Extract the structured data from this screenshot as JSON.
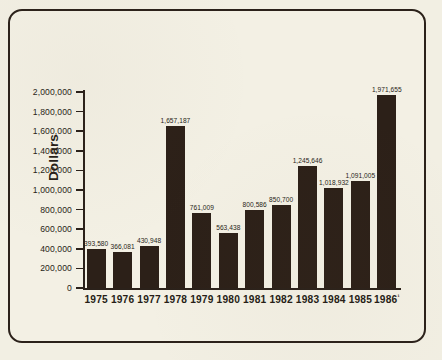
{
  "figure": {
    "background_color": "#f3f0e4",
    "ink_color": "#2b211a",
    "bar_color": "#2c2018"
  },
  "chart_data": {
    "type": "bar",
    "title": "",
    "xlabel": "",
    "ylabel": "Dollars",
    "ylim": [
      0,
      2000000
    ],
    "grid": false,
    "legend": null,
    "categories": [
      "1975",
      "1976",
      "1977",
      "1978",
      "1979",
      "1980",
      "1981",
      "1982",
      "1983",
      "1984",
      "1985",
      "1986"
    ],
    "category_labels": [
      "1975",
      "1976",
      "1977",
      "1978",
      "1979",
      "1980",
      "1981",
      "1982",
      "1983",
      "1984",
      "1985",
      "1986¹"
    ],
    "values": [
      393580,
      366081,
      430948,
      1657187,
      761009,
      563438,
      800586,
      850700,
      1245646,
      1018932,
      1091005,
      1971655
    ],
    "value_labels": [
      "393,580",
      "366,081",
      "430,948",
      "1,657,187",
      "761,009",
      "563,438",
      "800,586",
      "850,700",
      "1,245,646",
      "1,018,932",
      "1,091,005",
      "1,971,655"
    ],
    "ytick_values": [
      0,
      200000,
      400000,
      600000,
      800000,
      1000000,
      1200000,
      1400000,
      1600000,
      1800000,
      2000000
    ],
    "ytick_labels": [
      "0",
      "200,000",
      "400,000",
      "600,000",
      "800,000",
      "1,000,000",
      "1,200,000",
      "1,400,000",
      "1,600,000",
      "1,800,000",
      "2,000,000"
    ],
    "footnote_marker": "¹"
  }
}
